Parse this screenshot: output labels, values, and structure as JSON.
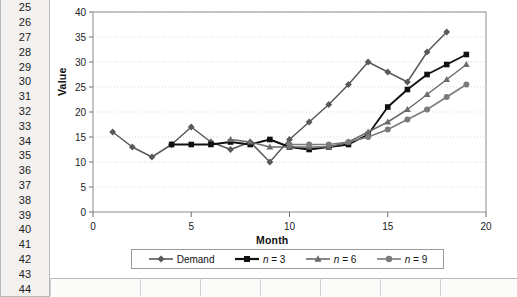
{
  "spreadsheet": {
    "row_numbers": [
      "25",
      "26",
      "27",
      "28",
      "29",
      "30",
      "31",
      "32",
      "33",
      "34",
      "35",
      "36",
      "37",
      "38",
      "39",
      "40",
      "41",
      "42",
      "43",
      "44"
    ]
  },
  "chart_data": {
    "type": "line",
    "title": "",
    "xlabel": "Month",
    "ylabel": "Value",
    "xlim": [
      0,
      20
    ],
    "ylim": [
      0,
      40
    ],
    "xticks": [
      "0",
      "5",
      "10",
      "15",
      "20"
    ],
    "yticks": [
      "0",
      "5",
      "10",
      "15",
      "20",
      "25",
      "30",
      "35",
      "40"
    ],
    "grid": true,
    "legend_position": "bottom",
    "x": [
      1,
      2,
      3,
      4,
      5,
      6,
      7,
      8,
      9,
      10,
      11,
      12,
      13,
      14,
      15,
      16,
      17,
      18,
      19
    ],
    "series": [
      {
        "name": "Demand",
        "marker": "diamond",
        "color": "#595959",
        "x": [
          1,
          2,
          3,
          4,
          5,
          6,
          7,
          8,
          9,
          10,
          11,
          12,
          13,
          14,
          15,
          16,
          17,
          18
        ],
        "values": [
          16,
          13,
          11,
          13.5,
          17,
          14,
          12.5,
          14,
          10,
          14.5,
          18,
          21.5,
          25.5,
          30,
          28,
          26,
          32,
          36
        ]
      },
      {
        "name": "n = 3",
        "marker": "square",
        "color": "#111111",
        "x": [
          4,
          5,
          6,
          7,
          8,
          9,
          10,
          11,
          12,
          13,
          14,
          15,
          16,
          17,
          18,
          19
        ],
        "values": [
          13.5,
          13.5,
          13.5,
          14,
          13.5,
          14.5,
          13,
          12.5,
          13,
          13.5,
          15.5,
          21,
          24.5,
          27.5,
          29.5,
          31.5
        ],
        "values_note": "3-month moving average"
      },
      {
        "name": "n = 6",
        "marker": "triangle",
        "color": "#6b6b6b",
        "x": [
          7,
          8,
          9,
          10,
          11,
          12,
          13,
          14,
          15,
          16,
          17,
          18,
          19
        ],
        "values": [
          14.5,
          14,
          13,
          13,
          13,
          13,
          14,
          16,
          18,
          20.5,
          23.5,
          26.5,
          29.5
        ],
        "values_note": "6-month moving average"
      },
      {
        "name": "n = 9",
        "marker": "circle",
        "color": "#7a7a7a",
        "x": [
          10,
          11,
          12,
          13,
          14,
          15,
          16,
          17,
          18,
          19
        ],
        "values": [
          13.5,
          13.5,
          13.5,
          14,
          15,
          16.5,
          18.5,
          20.5,
          23,
          25.5
        ],
        "values_note": "9-month moving average"
      }
    ]
  },
  "legend": {
    "items": [
      {
        "label": "Demand",
        "marker": "diamond-icon"
      },
      {
        "label": "n = 3",
        "marker": "square-icon"
      },
      {
        "label": "n = 6",
        "marker": "triangle-icon"
      },
      {
        "label": "n = 9",
        "marker": "circle-icon"
      }
    ]
  },
  "colors": {
    "plot_border": "#8c8c8c",
    "gridline": "#d9d9d9",
    "row_header_bg": "#f2f1ef",
    "row_header_border": "#b9b9b9"
  }
}
